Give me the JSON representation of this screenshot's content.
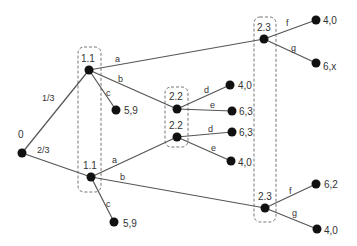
{
  "tree": {
    "nodes": {
      "root": {
        "label": "0",
        "x": 22,
        "y": 153
      },
      "p1_upper": {
        "label": "1.1",
        "x": 89,
        "y": 70
      },
      "p1_lower": {
        "label": "1.1",
        "x": 91,
        "y": 177
      },
      "p22_upper": {
        "label": "2.2",
        "x": 177,
        "y": 109
      },
      "p22_lower": {
        "label": "2.2",
        "x": 177,
        "y": 137
      },
      "p23_upper": {
        "label": "2.3",
        "x": 264,
        "y": 39
      },
      "p23_lower": {
        "label": "2.3",
        "x": 265,
        "y": 208
      }
    },
    "chance_probs": {
      "upper": "1/3",
      "lower": "2/3"
    },
    "actions": {
      "a": "a",
      "b": "b",
      "c": "c",
      "d": "d",
      "e": "e",
      "f": "f",
      "g": "g"
    },
    "payoffs": {
      "upper_c": "5,9",
      "lower_c": "5,9",
      "p22u_d": "4,0",
      "p22u_e": "6,3",
      "p22l_d": "6,3",
      "p22l_e": "4,0",
      "p23u_f": "4,0",
      "p23u_g": "6,x",
      "p23l_f": "6,2",
      "p23l_g": "4,0"
    }
  }
}
